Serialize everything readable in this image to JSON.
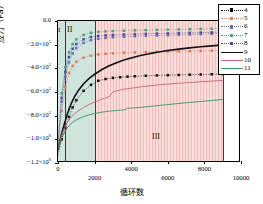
{
  "chart_data": {
    "type": "line",
    "title": "",
    "xlabel": "循环数",
    "ylabel": "应力（Pa）",
    "xlim": [
      0,
      10000
    ],
    "ylim": [
      -1200000,
      0
    ],
    "grid": false,
    "legend_position": "top-right",
    "xticks": [
      {
        "value": 0,
        "label": "0"
      },
      {
        "value": 2000,
        "label": "2000"
      },
      {
        "value": 4000,
        "label": "4000"
      },
      {
        "value": 6000,
        "label": "6000"
      },
      {
        "value": 8000,
        "label": "8000"
      },
      {
        "value": 10000,
        "label": "10000"
      }
    ],
    "yticks": [
      {
        "value": 0,
        "mantissa": "0.0",
        "exponent": ""
      },
      {
        "value": -200000,
        "mantissa": "−2.0×10",
        "exponent": "5"
      },
      {
        "value": -400000,
        "mantissa": "−4.0×10",
        "exponent": "5"
      },
      {
        "value": -600000,
        "mantissa": "−6.0×10",
        "exponent": "5"
      },
      {
        "value": -800000,
        "mantissa": "−8.0×10",
        "exponent": "5"
      },
      {
        "value": -1000000,
        "mantissa": "−1.0×10",
        "exponent": "6"
      },
      {
        "value": -1200000,
        "mantissa": "−1.2×10",
        "exponent": "6"
      }
    ],
    "regions": [
      {
        "label": "I",
        "x_start": 0,
        "x_end": 400,
        "color": "#cfe4dc",
        "hatch": false
      },
      {
        "label": "II",
        "x_start": 400,
        "x_end": 2000,
        "color": "#cfe4dc",
        "hatch": false
      },
      {
        "label": "III",
        "x_start": 2000,
        "x_end": 9000,
        "color": "#f7d5d2",
        "hatch": true
      }
    ],
    "series": [
      {
        "name": "4",
        "color": "#111111",
        "marker": "square",
        "style": "dotted-marker",
        "x": [
          0,
          200,
          400,
          600,
          800,
          1000,
          1400,
          1800,
          2200,
          2600,
          3000,
          3400,
          3800,
          4200,
          4800,
          5400,
          6000,
          6600,
          7200,
          7800,
          8400,
          9000
        ],
        "y": [
          -1130000,
          -1000000,
          -900000,
          -810000,
          -730000,
          -670000,
          -590000,
          -540000,
          -505000,
          -490000,
          -481000,
          -475000,
          -470000,
          -467000,
          -463000,
          -460000,
          -458000,
          -456000,
          -454000,
          -452000,
          -450000,
          -447000
        ]
      },
      {
        "name": "5",
        "color": "#e07a5f",
        "marker": "square",
        "style": "dotted-marker",
        "x": [
          0,
          200,
          400,
          600,
          800,
          1000,
          1400,
          1800,
          2200,
          2600,
          3000,
          3600,
          4200,
          4800,
          5400,
          6000,
          6600,
          7200,
          7800,
          8400,
          9000
        ],
        "y": [
          -1060000,
          -760000,
          -560000,
          -440000,
          -380000,
          -345000,
          -310000,
          -292000,
          -282000,
          -277000,
          -273000,
          -269000,
          -266000,
          -263000,
          -261000,
          -259000,
          -257000,
          -255000,
          -253000,
          -251000,
          -249000
        ]
      },
      {
        "name": "6",
        "color": "#6f6fa8",
        "marker": "square",
        "style": "dotted-marker",
        "x": [
          0,
          200,
          400,
          600,
          800,
          1000,
          1400,
          1800,
          2200,
          2600,
          3000,
          3600,
          4200,
          4800,
          5400,
          6000,
          6600,
          7200,
          7800,
          8400,
          9000
        ],
        "y": [
          -1050000,
          -680000,
          -470000,
          -350000,
          -275000,
          -230000,
          -185000,
          -162000,
          -150000,
          -143000,
          -138000,
          -133000,
          -129000,
          -126000,
          -123000,
          -120000,
          -117000,
          -114000,
          -111000,
          -108000,
          -105000
        ]
      },
      {
        "name": "7",
        "color": "#4f9e82",
        "marker": "square",
        "style": "dotted-marker",
        "x": [
          0,
          200,
          400,
          600,
          800,
          1000,
          1400,
          1800,
          2200,
          2600,
          3000,
          3600,
          4200,
          4800,
          5400,
          6000,
          6600,
          7200,
          7800,
          8400,
          9000
        ],
        "y": [
          -1040000,
          -610000,
          -390000,
          -265000,
          -195000,
          -155000,
          -118000,
          -100000,
          -92000,
          -88000,
          -85000,
          -82000,
          -79000,
          -77000,
          -75000,
          -73000,
          -71000,
          -69000,
          -67000,
          -65000,
          -63000
        ]
      },
      {
        "name": "8",
        "color": "#4a4f9c",
        "marker": "square",
        "style": "dotted-marker",
        "x": [
          0,
          200,
          400,
          600,
          800,
          1000,
          1400,
          1800,
          2200,
          2600,
          3000,
          3600,
          4200,
          4800,
          5400,
          6000,
          6600,
          7200,
          7800,
          8400,
          9000
        ],
        "y": [
          -1045000,
          -650000,
          -430000,
          -305000,
          -235000,
          -195000,
          -155000,
          -135000,
          -126000,
          -121000,
          -118000,
          -114000,
          -111000,
          -108000,
          -106000,
          -104000,
          -102000,
          -100000,
          -98000,
          -96000,
          -94000
        ]
      },
      {
        "name": "9",
        "color": "#111111",
        "marker": "none",
        "style": "solid-thick",
        "x": [
          0,
          150,
          300,
          500,
          700,
          900,
          1100,
          1400,
          1700,
          2000,
          2400,
          2800,
          3200,
          3600,
          4000,
          4500,
          5000,
          5500,
          6000,
          6600,
          7200,
          7800,
          8400,
          9000
        ],
        "y": [
          -1090000,
          -980000,
          -895000,
          -790000,
          -705000,
          -640000,
          -590000,
          -530000,
          -485000,
          -450000,
          -410000,
          -378000,
          -352000,
          -330000,
          -312000,
          -292000,
          -276000,
          -262000,
          -250000,
          -238000,
          -227000,
          -218000,
          -210000,
          -202000
        ]
      },
      {
        "name": "10",
        "color": "#d4636f",
        "marker": "none",
        "style": "solid-thin",
        "x": [
          0,
          150,
          300,
          500,
          700,
          900,
          1100,
          1400,
          1700,
          2000,
          2400,
          2800,
          3000,
          3200,
          3600,
          4000,
          4500,
          5000,
          5500,
          6000,
          6600,
          7200,
          7800,
          8400,
          9000
        ],
        "y": [
          -1075000,
          -985000,
          -925000,
          -860000,
          -815000,
          -785000,
          -760000,
          -730000,
          -705000,
          -685000,
          -660000,
          -640000,
          -600000,
          -590000,
          -577000,
          -568000,
          -557000,
          -548000,
          -540000,
          -533000,
          -526000,
          -520000,
          -514000,
          -508000,
          -502000
        ]
      },
      {
        "name": "11",
        "color": "#3f8f62",
        "marker": "none",
        "style": "solid-thin",
        "x": [
          0,
          150,
          300,
          500,
          700,
          900,
          1100,
          1400,
          1700,
          2000,
          2400,
          2800,
          3200,
          3600,
          3800,
          4000,
          4500,
          5000,
          5500,
          6000,
          6600,
          7200,
          7800,
          8400,
          9000
        ],
        "y": [
          -1080000,
          -1010000,
          -960000,
          -905000,
          -868000,
          -845000,
          -828000,
          -808000,
          -793000,
          -782000,
          -770000,
          -762000,
          -756000,
          -752000,
          -738000,
          -736000,
          -730000,
          -722000,
          -714000,
          -706000,
          -697000,
          -688000,
          -680000,
          -672000,
          -663000
        ]
      }
    ],
    "legend": [
      {
        "name": "4",
        "label": "4"
      },
      {
        "name": "5",
        "label": "5"
      },
      {
        "name": "6",
        "label": "6"
      },
      {
        "name": "7",
        "label": "7"
      },
      {
        "name": "8",
        "label": "8"
      },
      {
        "name": "9",
        "label": "9"
      },
      {
        "name": "10",
        "label": "10"
      },
      {
        "name": "11",
        "label": "11"
      }
    ]
  }
}
